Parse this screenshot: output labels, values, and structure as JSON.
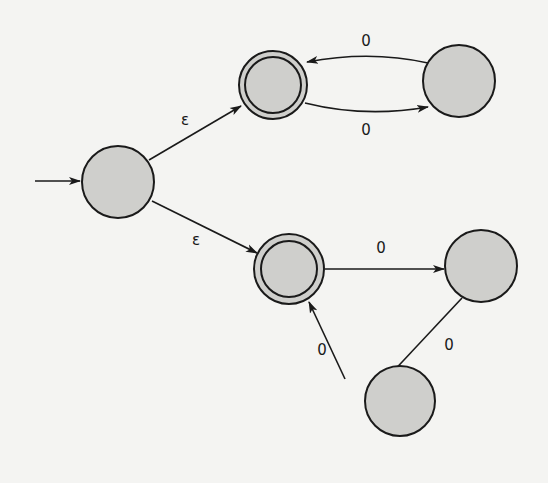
{
  "diagram": {
    "type": "nfa-state-diagram",
    "colors": {
      "background": "#f4f4f2",
      "state_fill": "#cfcfcc",
      "stroke": "#1a1a1a"
    },
    "states": [
      {
        "id": "q0",
        "start": true,
        "accepting": false
      },
      {
        "id": "q1",
        "start": false,
        "accepting": true
      },
      {
        "id": "q2",
        "start": false,
        "accepting": false
      },
      {
        "id": "q3",
        "start": false,
        "accepting": true
      },
      {
        "id": "q4",
        "start": false,
        "accepting": false
      },
      {
        "id": "q5",
        "start": false,
        "accepting": false
      }
    ],
    "transitions": [
      {
        "from": "q0",
        "to": "q1",
        "label": "ε"
      },
      {
        "from": "q0",
        "to": "q3",
        "label": "ε"
      },
      {
        "from": "q2",
        "to": "q1",
        "label": "0"
      },
      {
        "from": "q1",
        "to": "q2",
        "label": "0"
      },
      {
        "from": "q3",
        "to": "q4",
        "label": "0"
      },
      {
        "from": "q4",
        "to": "q5",
        "label": "0"
      },
      {
        "from": "q5",
        "to": "q3",
        "label": "0"
      }
    ],
    "labels": {
      "eps_top": "ε",
      "eps_bottom": "ε",
      "q2_to_q1": "0",
      "q1_to_q2": "0",
      "q3_to_q4": "0",
      "q4_to_q5": "0",
      "q5_to_q3": "0"
    }
  }
}
